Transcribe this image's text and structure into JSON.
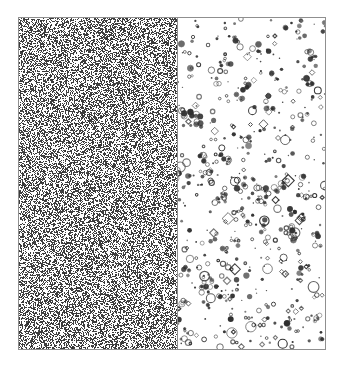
{
  "figure": {
    "canvas_width": 343,
    "canvas_height": 371,
    "background_color": "#ffffff",
    "frame": {
      "x": 18,
      "y": 17,
      "width": 308,
      "height": 333,
      "border_color": "#8f8f8f",
      "border_width": 1
    },
    "divider": {
      "x_offset": 158,
      "color": "#8f8f8f",
      "width": 1
    },
    "panels": [
      {
        "id": "noise",
        "role": "dense-random-noise-field",
        "x_offset": 0,
        "width": 158,
        "fill_color": "#ffffff",
        "speck_color": "#3a3a3a",
        "density": 0.46,
        "speck_size_px": 1,
        "seed": 20240517
      },
      {
        "id": "speckle",
        "role": "sparse-speckle-blob-field",
        "x_offset": 159,
        "width": 149,
        "fill_color": "#ffffff",
        "blob_color": "#2e2e2e",
        "blob_count": 430,
        "dot_fraction": 0.52,
        "ring_fraction": 0.34,
        "diamond_fraction": 0.14,
        "min_radius_px": 1,
        "max_radius_px": 6,
        "seed": 77310
      }
    ]
  },
  "chart_data": {
    "type": "scatter",
    "title": "",
    "subtitle": "",
    "xlabel": "",
    "ylabel": "",
    "grid": false,
    "legend_position": "none",
    "annotations": [],
    "panel_labels": [],
    "tick_labels": {
      "x": [],
      "y": []
    },
    "series": [
      {
        "name": "dense-noise-left-panel",
        "panel": "noise",
        "marker": "pixel",
        "color": "#3a3a3a",
        "point_count": 11500,
        "x_range": [
          0,
          158
        ],
        "y_range": [
          0,
          331
        ],
        "description": "Uniform high-density salt-and-pepper random field filling the entire left half of the frame."
      },
      {
        "name": "sparse-speckle-right-panel",
        "panel": "speckle",
        "marker": "mixed-dot-ring-diamond",
        "color": "#2e2e2e",
        "point_count": 430,
        "x_range": [
          0,
          149
        ],
        "y_range": [
          0,
          331
        ],
        "description": "Low-density scattered blobs: solid dots, small open rings, and a few larger diamond outlines, slightly clustered toward the lower half."
      }
    ]
  }
}
